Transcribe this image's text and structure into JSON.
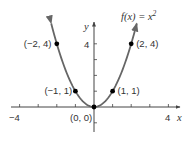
{
  "chart_data": {
    "type": "line",
    "function_label": {
      "base": "f(x) = x",
      "exponent": "2"
    },
    "xlabel": "x",
    "ylabel": "y",
    "xlim": [
      -4,
      4
    ],
    "ylim": [
      -1,
      5
    ],
    "x_ticks": [
      -4,
      -3,
      -2,
      -1,
      1,
      2,
      3,
      4
    ],
    "x_tick_labels": {
      "left": "−4",
      "right": "4"
    },
    "y_ticks": [
      -1,
      1,
      2,
      3,
      4
    ],
    "y_tick_labels": {
      "top": "4"
    },
    "grid": false,
    "legend": null,
    "series": [
      {
        "name": "f(x) = x^2",
        "x": [
          -2.3,
          -2,
          -1,
          0,
          1,
          2,
          2.3
        ],
        "y": [
          5.29,
          4,
          1,
          0,
          1,
          4,
          5.29
        ]
      }
    ],
    "points": [
      {
        "x": -2,
        "y": 4,
        "label": "(−2, 4)"
      },
      {
        "x": -1,
        "y": 1,
        "label": "(−1, 1)"
      },
      {
        "x": 0,
        "y": 0,
        "label": "(0, 0)"
      },
      {
        "x": 1,
        "y": 1,
        "label": "(1, 1)"
      },
      {
        "x": 2,
        "y": 4,
        "label": "(2, 4)"
      }
    ],
    "colors": {
      "curve": "#666666",
      "axes": "#444444",
      "points": "#000000",
      "text": "#333333"
    }
  }
}
